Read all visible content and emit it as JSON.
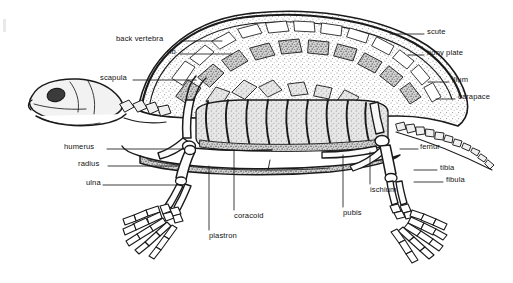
{
  "figure": {
    "background_color": "#ffffff",
    "ink_color": "#1a1a1a",
    "label_color": "#111111",
    "width": 513,
    "height": 283
  },
  "labels": {
    "back_vertebra": "back vertebra",
    "rib": "rib",
    "scapula": "scapula",
    "scute": "scute",
    "bony_plate": "bony plate",
    "ilium": "ilium",
    "carapace": "carapace",
    "humerus": "humerus",
    "radius": "radius",
    "ulna": "ulna",
    "femur": "femur",
    "tibia": "tibia",
    "fibula": "fibula",
    "ischium": "ischium",
    "pubis": "pubis",
    "coracoid": "coracoid",
    "plastron": "plastron"
  },
  "label_positions": [
    {
      "key": "back_vertebra",
      "text": "back vertebra",
      "x": 116,
      "y": 38,
      "align": "left",
      "leader": "horizontal-right"
    },
    {
      "key": "rib",
      "text": "rib",
      "x": 167,
      "y": 51,
      "align": "left",
      "leader": "horizontal-right"
    },
    {
      "key": "scapula",
      "text": "scapula",
      "x": 100,
      "y": 77,
      "align": "left",
      "leader": "horizontal-right"
    },
    {
      "key": "scute",
      "text": "scute",
      "x": 427,
      "y": 31,
      "align": "left",
      "leader": "horizontal-left"
    },
    {
      "key": "bony_plate",
      "text": "bony plate",
      "x": 427,
      "y": 52,
      "align": "left",
      "leader": "horizontal-left"
    },
    {
      "key": "ilium",
      "text": "ilium",
      "x": 452,
      "y": 79,
      "align": "left",
      "leader": "horizontal-left"
    },
    {
      "key": "carapace",
      "text": "carapace",
      "x": 458,
      "y": 96,
      "align": "left",
      "leader": "horizontal-left"
    },
    {
      "key": "humerus",
      "text": "humerus",
      "x": 64,
      "y": 146,
      "align": "left",
      "leader": "horizontal-right"
    },
    {
      "key": "radius",
      "text": "radius",
      "x": 78,
      "y": 163,
      "align": "left",
      "leader": "horizontal-right"
    },
    {
      "key": "ulna",
      "text": "ulna",
      "x": 86,
      "y": 182,
      "align": "left",
      "leader": "horizontal-right"
    },
    {
      "key": "femur",
      "text": "femur",
      "x": 420,
      "y": 146,
      "align": "left",
      "leader": "horizontal-left"
    },
    {
      "key": "tibia",
      "text": "tibia",
      "x": 440,
      "y": 167,
      "align": "left",
      "leader": "horizontal-left"
    },
    {
      "key": "fibula",
      "text": "fibula",
      "x": 446,
      "y": 179,
      "align": "left",
      "leader": "horizontal-left"
    },
    {
      "key": "ischium",
      "text": "ischium",
      "x": 370,
      "y": 190,
      "align": "left",
      "leader": "vertical-up"
    },
    {
      "key": "pubis",
      "text": "pubis",
      "x": 343,
      "y": 213,
      "align": "left",
      "leader": "vertical-up"
    },
    {
      "key": "coracoid",
      "text": "coracoid",
      "x": 234,
      "y": 216,
      "align": "left",
      "leader": "vertical-up"
    },
    {
      "key": "plastron",
      "text": "plastron",
      "x": 209,
      "y": 236,
      "align": "left",
      "leader": "vertical-up"
    }
  ],
  "anatomy_parts": [
    {
      "name": "skull",
      "region": "left",
      "description": "turtle skull in lateral view with dark orbit"
    },
    {
      "name": "carapace",
      "region": "top",
      "description": "domed upper shell with scutes and bony plates"
    },
    {
      "name": "plastron",
      "region": "bottom-center",
      "description": "flat lower shell plate"
    },
    {
      "name": "ribs",
      "region": "center",
      "description": "curved ribs fused beneath carapace"
    },
    {
      "name": "vertebral-column",
      "region": "top-center",
      "description": "back vertebrae along shell midline"
    },
    {
      "name": "front-limb",
      "region": "lower-left",
      "description": "humerus, radius, ulna and splayed manus"
    },
    {
      "name": "hind-limb",
      "region": "lower-right",
      "description": "femur, tibia, fibula and splayed pes"
    },
    {
      "name": "pelvis",
      "region": "right",
      "description": "ilium, ischium and pubis"
    },
    {
      "name": "tail",
      "region": "far-right",
      "description": "segmented caudal vertebrae"
    },
    {
      "name": "pectoral-girdle",
      "region": "center-left",
      "description": "scapula and coracoid strut"
    }
  ]
}
